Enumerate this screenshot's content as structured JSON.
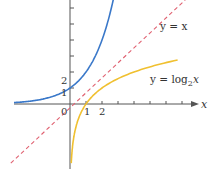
{
  "chart_data": {
    "type": "line",
    "title": "",
    "xlabel": "x",
    "ylabel": "",
    "grid": false,
    "origin_px": [
      70,
      104
    ],
    "unit_px": 16,
    "x_tick_labels": [
      "0",
      "1",
      "2"
    ],
    "y_tick_labels": [
      "1",
      "2"
    ],
    "x_ticks": [
      1,
      2,
      3,
      4,
      5,
      6,
      7
    ],
    "y_ticks": [
      1,
      2,
      3,
      4,
      5,
      6
    ],
    "series": [
      {
        "name": "y = 2^x",
        "color": "#3a78c9",
        "style": "solid",
        "x": [
          -3.5,
          -3,
          -2,
          -1,
          0,
          0.5,
          1,
          1.5,
          2,
          2.5,
          2.75
        ],
        "y": [
          0.09,
          0.125,
          0.25,
          0.5,
          1,
          1.41,
          2,
          2.83,
          4,
          5.66,
          6.73
        ]
      },
      {
        "name": "y = x",
        "label": "y = x",
        "color": "#e06070",
        "style": "dashed",
        "x": [
          -3.7,
          7.2
        ],
        "y": [
          -3.7,
          6.5
        ]
      },
      {
        "name": "y = log2 x",
        "color": "#f0c030",
        "style": "solid",
        "x": [
          0.09,
          0.125,
          0.25,
          0.5,
          1,
          1.41,
          2,
          2.83,
          4,
          5.66,
          6.73
        ],
        "y": [
          -3.5,
          -3,
          -2,
          -1,
          0,
          0.5,
          1,
          1.5,
          2,
          2.5,
          2.75
        ]
      }
    ],
    "annotations": [
      {
        "text": "y = x",
        "x": 6.8,
        "y": 4.8
      },
      {
        "text": "y = log",
        "sub": "2",
        "tail": "x",
        "x": 6.8,
        "y": 2.3
      }
    ]
  },
  "labels": {
    "axis_x": "x",
    "origin": "0",
    "x1": "1",
    "x2": "2",
    "y1": "1",
    "y2": "2",
    "line_label": "y = x",
    "log_label_main": "y = log",
    "log_label_sub": "2",
    "log_label_tail": "x"
  }
}
